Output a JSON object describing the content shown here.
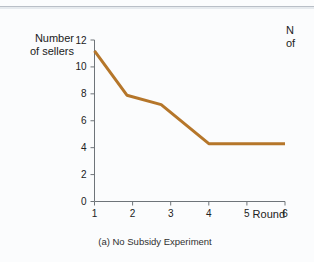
{
  "figure": {
    "caption": "(a) No Subsidy Experiment",
    "y_axis_title": "Number\nof sellers",
    "x_axis_title": "Round",
    "neighbor_panel_partial_label": "N\nof"
  },
  "colors": {
    "line": "#b5762a",
    "axis": "#6e7479",
    "text": "#212121",
    "background": "#fbfcfd",
    "rule": "#b9bfc7"
  },
  "chart_data": {
    "type": "line",
    "title": "(a) No Subsidy Experiment",
    "xlabel": "Round",
    "ylabel": "Number of sellers",
    "xlim": [
      1,
      6
    ],
    "ylim": [
      0,
      12
    ],
    "xticks": [
      "1",
      "2",
      "3",
      "4",
      "5",
      "6"
    ],
    "yticks": [
      "0",
      "2",
      "4",
      "6",
      "8",
      "10",
      "12"
    ],
    "grid": false,
    "legend": null,
    "series": [
      {
        "name": "Number of sellers",
        "color": "#b5762a",
        "x": [
          1,
          1.85,
          2.75,
          4,
          6
        ],
        "values": [
          11.2,
          7.9,
          7.2,
          4.3,
          4.3
        ]
      }
    ]
  }
}
